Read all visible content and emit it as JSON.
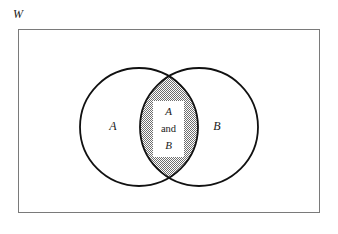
{
  "figure": {
    "type": "venn-diagram",
    "universe_label": "W",
    "background_color": "#ffffff",
    "rectangle": {
      "name": "universal-set-rectangle",
      "x": 18,
      "y": 29,
      "width": 302,
      "height": 184,
      "stroke_color": "#7a7a7a",
      "stroke_width": 1,
      "fill": "none"
    },
    "circles": [
      {
        "name": "set-a-circle",
        "label": "A",
        "cx": 139,
        "cy": 127,
        "r": 59,
        "stroke_color": "#111111",
        "stroke_width": 1.8,
        "fill": "none"
      },
      {
        "name": "set-b-circle",
        "label": "B",
        "cx": 199,
        "cy": 127,
        "r": 59,
        "stroke_color": "#111111",
        "stroke_width": 1.8,
        "fill": "none"
      }
    ],
    "intersection": {
      "name": "a-and-b-region",
      "fill_pattern": "stipple-dots",
      "fill_color": "#666666",
      "lines": [
        "A",
        "and",
        "B"
      ],
      "top_crossing": {
        "x": 169,
        "y": 80
      },
      "bottom_crossing": {
        "x": 169,
        "y": 174
      }
    },
    "labels": {
      "a_only": "A",
      "b_only": "B",
      "intersection_line1": "A",
      "intersection_line2": "and",
      "intersection_line3": "B"
    }
  }
}
